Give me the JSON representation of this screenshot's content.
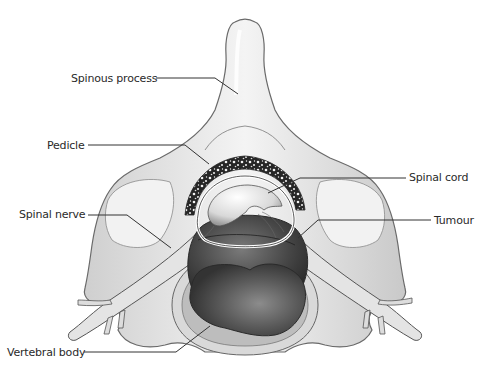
{
  "diagram": {
    "labels": [
      {
        "id": "spinous-process",
        "text": "Spinous process",
        "x": 71,
        "y": 72
      },
      {
        "id": "pedicle",
        "text": "Pedicle",
        "x": 47,
        "y": 139
      },
      {
        "id": "spinal-cord",
        "text": "Spinal cord",
        "x": 409,
        "y": 171
      },
      {
        "id": "spinal-nerve",
        "text": "Spinal nerve",
        "x": 19,
        "y": 208
      },
      {
        "id": "tumour",
        "text": "Tumour",
        "x": 434,
        "y": 214
      },
      {
        "id": "vertebral-body",
        "text": "Vertebral body",
        "x": 7,
        "y": 346
      }
    ],
    "colors": {
      "bone": "#e9e9e9",
      "bone_shadow": "#bdbdbd",
      "outline": "#5a5a5a",
      "tumour_dark": "#3a3a3a",
      "tumour_mid": "#6b6b6b",
      "cancellous": "#2b2b2b",
      "leader": "#333333"
    }
  }
}
